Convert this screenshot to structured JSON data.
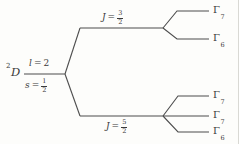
{
  "diagram": {
    "term": {
      "superscript": "2",
      "symbol": "D"
    },
    "base_state": {
      "l_symbol": "l",
      "l_eq": "=",
      "l_value": "2",
      "s_symbol": "s",
      "s_eq": "=",
      "s_num": "1",
      "s_den": "2"
    },
    "levels": {
      "j32": {
        "symbol": "J",
        "eq": "=",
        "num": "3",
        "den": "2",
        "sublevels": [
          {
            "symbol": "Γ",
            "sub": "7"
          },
          {
            "symbol": "Γ",
            "sub": "6"
          }
        ]
      },
      "j52": {
        "symbol": "J",
        "eq": "=",
        "num": "5",
        "den": "2",
        "sublevels": [
          {
            "symbol": "Γ",
            "sub": "7"
          },
          {
            "symbol": "Γ",
            "sub": "7"
          },
          {
            "symbol": "Γ",
            "sub": "6"
          }
        ]
      }
    },
    "colors": {
      "line": "#4d4d4d",
      "text": "#3a3a3a",
      "background": "#fdfdfb",
      "scan_edge": "#d9d9d4"
    }
  }
}
